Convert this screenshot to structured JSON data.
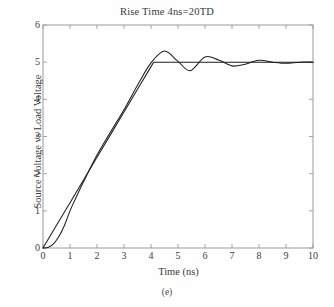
{
  "chart_data": {
    "type": "line",
    "title": "Rise Time 4ns=20TD",
    "xlabel": "Time (ns)",
    "ylabel": "Source Voltage vs Load Voltage",
    "caption": "(e)",
    "xlim": [
      0,
      10
    ],
    "ylim": [
      0,
      6
    ],
    "xticks": [
      "0",
      "1",
      "2",
      "3",
      "4",
      "5",
      "6",
      "7",
      "8",
      "9",
      "10"
    ],
    "yticks": [
      "0",
      "1",
      "2",
      "3",
      "4",
      "5",
      "6"
    ],
    "xtick_values": [
      0,
      1,
      2,
      3,
      4,
      5,
      6,
      7,
      8,
      9,
      10
    ],
    "ytick_values": [
      0,
      1,
      2,
      3,
      4,
      5,
      6
    ],
    "grid": false,
    "legend": "none",
    "line_color": "#1f1f1f",
    "frame_color": "#9a9a9a",
    "series": [
      {
        "name": "Source Voltage",
        "description": "Trapezoidal ramp: linear rise from 0 V at 0 ns to 5 V at 4.1 ns, then constant 5 V",
        "x": [
          0,
          0.5,
          1,
          1.5,
          2,
          2.5,
          3,
          3.5,
          4,
          4.1,
          5,
          6,
          7,
          8,
          9,
          10
        ],
        "values": [
          0,
          0.61,
          1.22,
          1.83,
          2.44,
          3.05,
          3.66,
          4.27,
          4.88,
          5.0,
          5.0,
          5.0,
          5.0,
          5.0,
          5.0,
          5.0
        ]
      },
      {
        "name": "Load Voltage",
        "description": "Delayed S-shaped rise with overshoot to 5.3 V near 4.5 ns, then decaying ringing settling to 5 V",
        "x": [
          0,
          0.2,
          0.4,
          0.6,
          0.8,
          1.0,
          1.2,
          1.5,
          2.0,
          2.5,
          3.0,
          3.5,
          4.0,
          4.5,
          5.0,
          5.45,
          6.0,
          6.5,
          7.0,
          7.4,
          8.0,
          8.5,
          9.0,
          9.5,
          10.0
        ],
        "values": [
          0,
          0.02,
          0.12,
          0.32,
          0.62,
          1.0,
          1.32,
          1.78,
          2.5,
          3.12,
          3.72,
          4.38,
          4.98,
          5.3,
          5.02,
          4.77,
          5.14,
          5.06,
          4.9,
          4.93,
          5.05,
          5.0,
          4.97,
          5.0,
          5.0
        ]
      }
    ],
    "annotations": {
      "overshoot_peak": {
        "x": 4.5,
        "y": 5.3
      },
      "first_undershoot": {
        "x": 5.45,
        "y": 4.77
      },
      "second_overshoot": {
        "x": 6.05,
        "y": 5.14
      },
      "steady_state": 5.0,
      "rise_time_ns": 4,
      "rise_time_in_TD": 20
    }
  }
}
